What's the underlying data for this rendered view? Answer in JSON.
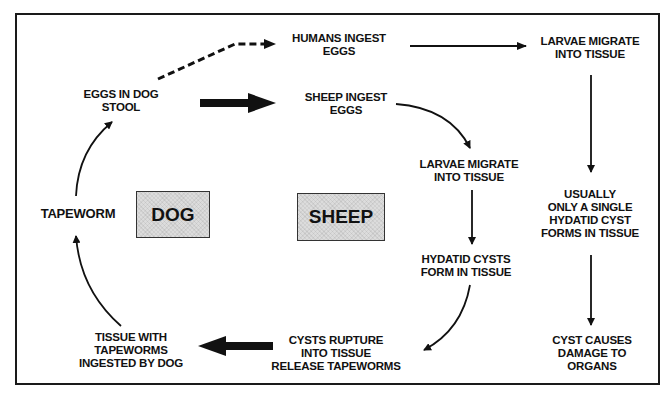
{
  "diagram": {
    "type": "life-cycle-flowchart",
    "hosts": {
      "dog": "DOG",
      "sheep": "SHEEP"
    },
    "nodes": {
      "eggs_in_dog_stool": [
        "EGGS IN DOG",
        "STOOL"
      ],
      "humans_ingest_eggs": [
        "HUMANS INGEST",
        "EGGS"
      ],
      "larvae_migrate_human": [
        "LARVAE MIGRATE",
        "INTO TISSUE"
      ],
      "sheep_ingest_eggs": [
        "SHEEP INGEST",
        "EGGS"
      ],
      "larvae_migrate_sheep": [
        "LARVAE MIGRATE",
        "INTO TISSUE"
      ],
      "single_cyst": [
        "USUALLY",
        "ONLY A SINGLE",
        "HYDATID CYST",
        "FORMS IN TISSUE"
      ],
      "hydatid_cysts_form": [
        "HYDATID CYSTS",
        "FORM IN TISSUE"
      ],
      "cyst_damage": [
        "CYST CAUSES",
        "DAMAGE TO",
        "ORGANS"
      ],
      "cysts_rupture": [
        "CYSTS RUPTURE",
        "INTO TISSUE",
        "RELEASE TAPEWORMS"
      ],
      "tissue_ingested": [
        "TISSUE WITH",
        "TAPEWORMS",
        "INGESTED BY DOG"
      ],
      "tapeworm": [
        "TAPEWORM"
      ]
    },
    "edges": [
      {
        "from": "eggs_in_dog_stool",
        "to": "humans_ingest_eggs",
        "style": "dashed"
      },
      {
        "from": "eggs_in_dog_stool",
        "to": "sheep_ingest_eggs",
        "style": "thick"
      },
      {
        "from": "humans_ingest_eggs",
        "to": "larvae_migrate_human",
        "style": "solid"
      },
      {
        "from": "larvae_migrate_human",
        "to": "single_cyst",
        "style": "solid"
      },
      {
        "from": "single_cyst",
        "to": "cyst_damage",
        "style": "solid"
      },
      {
        "from": "sheep_ingest_eggs",
        "to": "larvae_migrate_sheep",
        "style": "curved"
      },
      {
        "from": "larvae_migrate_sheep",
        "to": "hydatid_cysts_form",
        "style": "solid"
      },
      {
        "from": "hydatid_cysts_form",
        "to": "cysts_rupture",
        "style": "curved"
      },
      {
        "from": "cysts_rupture",
        "to": "tissue_ingested",
        "style": "thick"
      },
      {
        "from": "tissue_ingested",
        "to": "tapeworm",
        "style": "curved"
      },
      {
        "from": "tapeworm",
        "to": "eggs_in_dog_stool",
        "style": "curved"
      }
    ]
  }
}
